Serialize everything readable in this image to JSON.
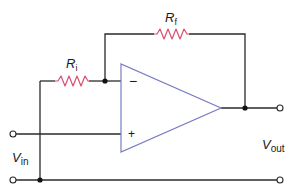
{
  "diagram": {
    "type": "inverting-op-amp-circuit",
    "colors": {
      "wire": "#2a2a2a",
      "resistor": "#d9506e",
      "opamp": "#7a7cc0",
      "background": "#ffffff"
    },
    "labels": {
      "rf": {
        "main": "R",
        "sub": "f"
      },
      "ri": {
        "main": "R",
        "sub": "i"
      },
      "vin": {
        "main": "V",
        "sub": "in"
      },
      "vout": {
        "main": "V",
        "sub": "out"
      },
      "inverting_input": "−",
      "noninverting_input": "+"
    },
    "components": [
      {
        "id": "Ri",
        "kind": "resistor",
        "label": "Ri"
      },
      {
        "id": "Rf",
        "kind": "resistor",
        "label": "Rf"
      },
      {
        "id": "opamp",
        "kind": "operational-amplifier"
      }
    ],
    "terminals": [
      "vin-top",
      "vin-bottom",
      "vout-top",
      "vout-bottom"
    ]
  }
}
